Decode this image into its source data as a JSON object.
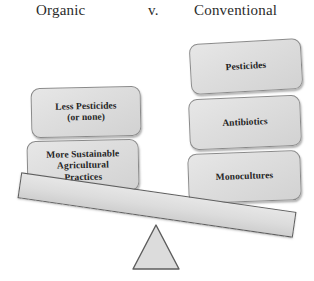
{
  "diagram": {
    "title_row": {
      "left_label": "Organic",
      "versus_label": "v.",
      "right_label": "Conventional"
    },
    "colors": {
      "box_fill": "#dedede",
      "box_border": "#8a8a8a",
      "beam_fill": "#dcdcdc",
      "beam_border": "#5d5d5d",
      "fulcrum_fill": "#dcdcdc",
      "fulcrum_border": "#5d5d5d",
      "text": "#242424",
      "background": "#ffffff"
    },
    "left_side": {
      "name": "Organic",
      "boxes": [
        {
          "id": "less-pesticides",
          "label": "Less Pesticides\n(or none)"
        },
        {
          "id": "more-sustainable",
          "label": "More Sustainable\nAgricultural\nPractices"
        }
      ]
    },
    "right_side": {
      "name": "Conventional",
      "boxes": [
        {
          "id": "pesticides",
          "label": "Pesticides"
        },
        {
          "id": "antibiotics",
          "label": "Antibiotics"
        },
        {
          "id": "monocultures",
          "label": "Monocultures"
        }
      ]
    },
    "seesaw": {
      "tilt_direction": "right-side-down",
      "tilt_degrees": 8.2,
      "fulcrum_shape": "triangle"
    }
  }
}
